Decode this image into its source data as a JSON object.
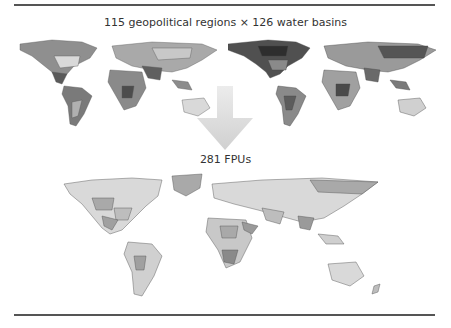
{
  "figure": {
    "top_label": "115 geopolitical regions × 126 water basins",
    "bottom_label": "281 FPUs",
    "top_maps": [
      {
        "name": "geopolitical-regions-map",
        "description": "World map shaded by 115 geopolitical regions"
      },
      {
        "name": "water-basins-map",
        "description": "World map shaded by 126 water basins"
      }
    ],
    "bottom_map": {
      "name": "fpu-map",
      "description": "World map shaded by 281 food producing units"
    },
    "arrow": {
      "direction": "down",
      "color": "#d8d8d8"
    },
    "colors": {
      "rule": "#555555",
      "land_light": "#d9d9d9",
      "land_mid": "#a9a9a9",
      "land_dark": "#6e6e6e",
      "land_darkest": "#3c3c3c"
    }
  }
}
